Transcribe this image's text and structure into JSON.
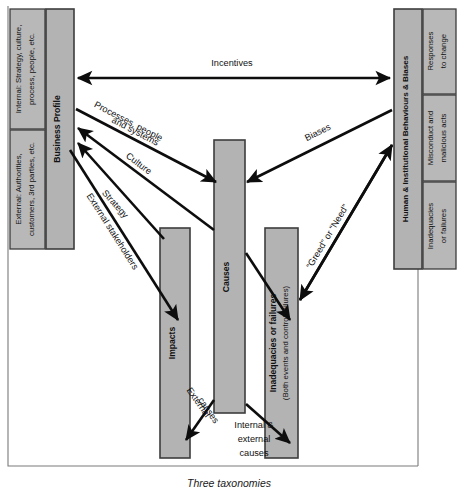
{
  "figure": {
    "caption": "Three taxonomies",
    "colors": {
      "box_fill": "#b3b3b3",
      "box_stroke": "#3d3d3d",
      "arrow": "#0d0d0d",
      "frame": "#7a7a7a",
      "background": "#ffffff"
    }
  },
  "left_panel": {
    "main_label": "Business Profile",
    "sub_boxes": [
      {
        "id": "internal",
        "lines": [
          "Internal: Strategy, culture,",
          "process, people, etc."
        ]
      },
      {
        "id": "external",
        "lines": [
          "External: Authorities,",
          "customers, 3rd parties, etc."
        ]
      }
    ]
  },
  "right_panel": {
    "main_label": "Human & Institutional Behaviours & Biases",
    "sub_boxes": [
      {
        "id": "responses",
        "lines": [
          "Responses",
          "to change"
        ]
      },
      {
        "id": "misconduct",
        "lines": [
          "Misconduct and",
          "malicious acts"
        ]
      },
      {
        "id": "inadequacies",
        "lines": [
          "Inadequacies",
          "or failures"
        ]
      }
    ]
  },
  "center_bars": [
    {
      "id": "causes",
      "lines": [
        "Causes"
      ]
    },
    {
      "id": "impacts",
      "lines": [
        "Impacts"
      ]
    },
    {
      "id": "inadequacies-failures",
      "lines": [
        "Inadequacies or failures",
        "(Both events and control failures)"
      ]
    }
  ],
  "edge_labels": {
    "incentives": "Incentives",
    "processes": [
      "Processes, people",
      "and systems"
    ],
    "culture": "Culture",
    "strategy": "Strategy",
    "external_stakeholders": "External stakeholders",
    "biases": "Biases",
    "greed_or_need": "“Greed” or “Need”",
    "external_causes": [
      "External",
      "causes"
    ],
    "internal_external_causes": [
      "Internal &",
      "external",
      "causes"
    ]
  }
}
